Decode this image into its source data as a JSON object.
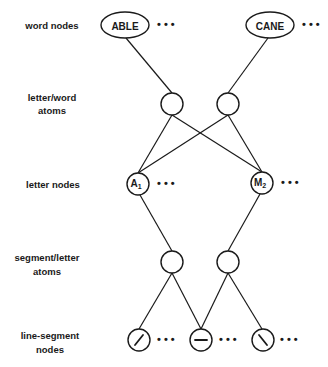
{
  "labels": {
    "word_nodes": "word nodes",
    "letter_word_atoms_1": "letter/word",
    "letter_word_atoms_2": "atoms",
    "letter_nodes": "letter nodes",
    "segment_letter_atoms_1": "segment/letter",
    "segment_letter_atoms_2": "atoms",
    "line_segment_nodes_1": "line-segment",
    "line_segment_nodes_2": "nodes"
  },
  "word_nodes": [
    {
      "id": "able",
      "label": "ABLE",
      "ellipsis": "• • •"
    },
    {
      "id": "cane",
      "label": "CANE",
      "ellipsis": "• • •"
    }
  ],
  "letter_nodes": [
    {
      "id": "a1",
      "letter": "A",
      "subscript": "1",
      "ellipsis": "• • •"
    },
    {
      "id": "m2",
      "letter": "M",
      "subscript": "2",
      "ellipsis": "• • •"
    }
  ],
  "line_segment_nodes": [
    {
      "id": "seg-diag-up",
      "glyph": "forward-slash",
      "ellipsis": "• • •"
    },
    {
      "id": "seg-horizontal",
      "glyph": "horizontal",
      "ellipsis": "• • •"
    },
    {
      "id": "seg-diag-down",
      "glyph": "back-slash",
      "ellipsis": "• • •"
    }
  ],
  "edges": [
    [
      "ABLE",
      "letter/word atom 1"
    ],
    [
      "CANE",
      "letter/word atom 2"
    ],
    [
      "letter/word atom 1",
      "A1"
    ],
    [
      "letter/word atom 1",
      "M2"
    ],
    [
      "letter/word atom 2",
      "A1"
    ],
    [
      "letter/word atom 2",
      "M2"
    ],
    [
      "A1",
      "segment/letter atom 1"
    ],
    [
      "M2",
      "segment/letter atom 2"
    ],
    [
      "segment/letter atom 1",
      "line-segment /"
    ],
    [
      "segment/letter atom 1",
      "line-segment —"
    ],
    [
      "segment/letter atom 2",
      "line-segment —"
    ],
    [
      "segment/letter atom 2",
      "line-segment \\"
    ]
  ]
}
